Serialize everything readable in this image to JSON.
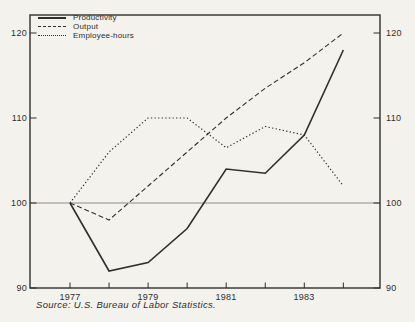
{
  "chart_data": {
    "type": "line",
    "title": "",
    "x": [
      1977,
      1978,
      1979,
      1980,
      1981,
      1982,
      1983,
      1984
    ],
    "series": [
      {
        "name": "Productivity",
        "line_style": "solid",
        "values": [
          100,
          92,
          93,
          97,
          104,
          103.5,
          108,
          118
        ]
      },
      {
        "name": "Output",
        "line_style": "dashed",
        "values": [
          100,
          98,
          102,
          106,
          110,
          113.5,
          116.5,
          120
        ]
      },
      {
        "name": "Employee-hours",
        "line_style": "dotted",
        "values": [
          100,
          106,
          110,
          110,
          106.5,
          109,
          108,
          102
        ]
      }
    ],
    "ylim": [
      90,
      122
    ],
    "yticks": [
      90,
      100,
      110,
      120
    ],
    "ytick_labels": [
      "120",
      "110",
      "100",
      "90"
    ],
    "xtick_labels": [
      "1977",
      "1979",
      "1981",
      "1983"
    ],
    "reference_line": 100,
    "grid": false,
    "legend_position": "top-left",
    "source": "Source: U.S. Bureau of Labor Statistics."
  },
  "colors": {
    "line": "#2f2f2f",
    "reference_line": "#8c8c8c",
    "paper": "#f4f2ec",
    "text": "#2f2f2f"
  }
}
